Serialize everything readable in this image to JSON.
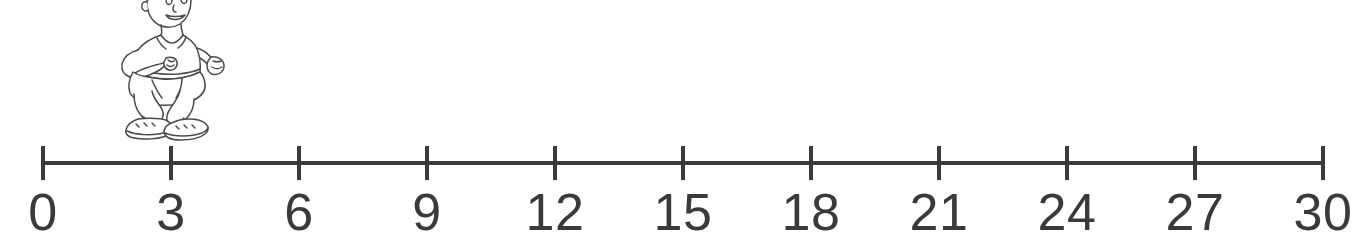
{
  "page": {
    "background_color": "#ffffff",
    "ink_color": "#3a3a3a"
  },
  "chart_data": {
    "type": "line",
    "xlabel": "",
    "ylabel": "",
    "grid": false,
    "legend": false,
    "axis_range": [
      0,
      30
    ],
    "tick_interval": 3,
    "tick_labels": [
      "0",
      "3",
      "6",
      "9",
      "12",
      "15",
      "18",
      "21",
      "24",
      "27",
      "30"
    ],
    "tick_values": [
      0,
      3,
      6,
      9,
      12,
      15,
      18,
      21,
      24,
      27,
      30
    ],
    "annotations": [
      {
        "name": "crouching-boy",
        "description": "line drawing of a boy crouching as if about to jump",
        "at_value": 3
      }
    ]
  },
  "numberline": {
    "start_x": 43,
    "end_x": 1323,
    "axis_y": 163,
    "tick_top": 146,
    "tick_bottom": 180,
    "label_y": 186,
    "stroke_width": 4,
    "ticks": [
      {
        "label": "0",
        "value": 0,
        "x": 43
      },
      {
        "label": "3",
        "value": 3,
        "x": 171
      },
      {
        "label": "6",
        "value": 6,
        "x": 299
      },
      {
        "label": "9",
        "value": 9,
        "x": 427
      },
      {
        "label": "12",
        "value": 12,
        "x": 555
      },
      {
        "label": "15",
        "value": 15,
        "x": 683
      },
      {
        "label": "18",
        "value": 18,
        "x": 811
      },
      {
        "label": "21",
        "value": 21,
        "x": 939
      },
      {
        "label": "24",
        "value": 24,
        "x": 1067
      },
      {
        "label": "27",
        "value": 27,
        "x": 1195
      },
      {
        "label": "30",
        "value": 30,
        "x": 1323
      }
    ]
  },
  "figure": {
    "name": "crouching-boy-illustration",
    "standing_on_value": 3,
    "left": 112,
    "top": -6,
    "width": 118,
    "height": 150
  }
}
